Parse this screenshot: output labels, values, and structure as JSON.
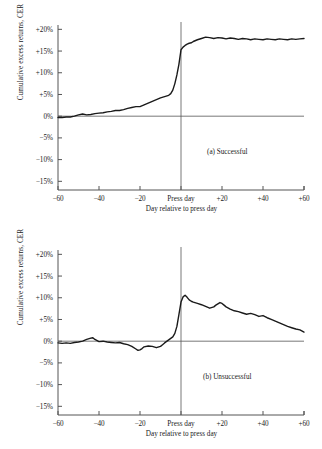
{
  "figure": {
    "title": "",
    "background_color": "#ffffff",
    "line_color": "#1a1a1a",
    "axis_color": "#555555"
  },
  "panels": [
    {
      "id": "a",
      "tag": "(a)  Successful",
      "xlabel": "Day relative to press day",
      "ylabel": "Cumulative excess returns, CER",
      "yticks": [
        "+20%",
        "+15%",
        "+10%",
        "+5%",
        "0%",
        "−5%",
        "−10%",
        "−15%"
      ],
      "ytick_values": [
        20,
        15,
        10,
        5,
        0,
        -5,
        -10,
        -15
      ],
      "xticks": [
        "−60",
        "−40",
        "−20",
        "Press day",
        "+20",
        "+40",
        "+60"
      ],
      "xtick_values": [
        -60,
        -40,
        -20,
        0,
        20,
        40,
        60
      ]
    },
    {
      "id": "b",
      "tag": "(b)  Unsuccessful",
      "xlabel": "Day relative to press day",
      "ylabel": "Cumulative excess returns, CER",
      "yticks": [
        "+20%",
        "+15%",
        "+10%",
        "+5%",
        "0%",
        "−5%",
        "−10%",
        "−15%"
      ],
      "ytick_values": [
        20,
        15,
        10,
        5,
        0,
        -5,
        -10,
        -15
      ],
      "xticks": [
        "−60",
        "−40",
        "−20",
        "Press day",
        "+20",
        "+40",
        "+60"
      ],
      "xtick_values": [
        -60,
        -40,
        -20,
        0,
        20,
        40,
        60
      ]
    }
  ],
  "chart_data": [
    {
      "type": "line",
      "title": "(a)  Successful",
      "xlabel": "Day relative to press day",
      "ylabel": "Cumulative excess returns, CER",
      "xlim": [
        -60,
        60
      ],
      "ylim": [
        -17,
        21
      ],
      "grid": false,
      "legend": "none",
      "annotations": [
        "Press day vertical reference line at x = 0",
        "Zero horizontal reference line at y = 0%"
      ],
      "x": [
        -60,
        -58,
        -56,
        -54,
        -52,
        -50,
        -48,
        -46,
        -44,
        -42,
        -40,
        -38,
        -36,
        -34,
        -32,
        -30,
        -28,
        -26,
        -24,
        -22,
        -20,
        -18,
        -16,
        -14,
        -12,
        -10,
        -8,
        -6,
        -5,
        -4,
        -3,
        -2,
        -1,
        0,
        1,
        2,
        3,
        4,
        5,
        6,
        8,
        10,
        12,
        14,
        16,
        18,
        20,
        22,
        24,
        26,
        28,
        30,
        32,
        34,
        36,
        38,
        40,
        42,
        44,
        46,
        48,
        50,
        52,
        54,
        56,
        58,
        60
      ],
      "y": [
        -0.3,
        -0.3,
        -0.2,
        -0.2,
        0.0,
        0.3,
        0.5,
        0.3,
        0.4,
        0.6,
        0.7,
        0.8,
        1.0,
        1.1,
        1.3,
        1.3,
        1.5,
        1.8,
        2.0,
        2.2,
        2.2,
        2.6,
        3.0,
        3.4,
        3.8,
        4.2,
        4.5,
        4.8,
        5.2,
        6.0,
        7.5,
        9.5,
        12.0,
        15.3,
        15.9,
        16.3,
        16.6,
        16.8,
        16.9,
        17.2,
        17.6,
        17.9,
        18.2,
        18.1,
        17.9,
        18.1,
        18.0,
        17.8,
        18.0,
        17.9,
        17.7,
        17.9,
        17.8,
        17.6,
        17.8,
        17.7,
        17.6,
        17.8,
        17.7,
        17.6,
        17.8,
        17.7,
        17.6,
        17.8,
        17.7,
        17.8,
        17.9
      ]
    },
    {
      "type": "line",
      "title": "(b)  Unsuccessful",
      "xlabel": "Day relative to press day",
      "ylabel": "Cumulative excess returns, CER",
      "xlim": [
        -60,
        60
      ],
      "ylim": [
        -17,
        21
      ],
      "grid": false,
      "legend": "none",
      "annotations": [
        "Press day vertical reference line at x = 0",
        "Zero horizontal reference line at y = 0%"
      ],
      "x": [
        -60,
        -58,
        -56,
        -54,
        -52,
        -50,
        -48,
        -46,
        -44,
        -43,
        -42,
        -40,
        -38,
        -36,
        -34,
        -32,
        -30,
        -28,
        -26,
        -24,
        -22,
        -21,
        -20,
        -19,
        -18,
        -16,
        -14,
        -12,
        -10,
        -9,
        -8,
        -6,
        -4,
        -3,
        -2,
        -1,
        0,
        1,
        2,
        3,
        4,
        5,
        6,
        8,
        10,
        12,
        14,
        16,
        17,
        18,
        19,
        20,
        21,
        22,
        24,
        26,
        28,
        30,
        32,
        34,
        36,
        38,
        40,
        42,
        44,
        46,
        48,
        50,
        52,
        54,
        56,
        58,
        60
      ],
      "y": [
        -0.4,
        -0.5,
        -0.4,
        -0.5,
        -0.3,
        -0.2,
        0.0,
        0.4,
        0.7,
        0.8,
        0.4,
        -0.1,
        0.0,
        -0.2,
        -0.3,
        -0.4,
        -0.3,
        -0.6,
        -0.8,
        -1.2,
        -1.8,
        -2.1,
        -2.0,
        -1.7,
        -1.3,
        -1.1,
        -1.2,
        -1.5,
        -1.2,
        -0.8,
        -0.4,
        0.3,
        1.0,
        1.8,
        3.4,
        6.2,
        9.0,
        10.2,
        10.6,
        10.1,
        9.5,
        9.2,
        9.0,
        8.7,
        8.4,
        8.0,
        7.6,
        7.9,
        8.3,
        8.6,
        8.9,
        8.7,
        8.3,
        7.9,
        7.4,
        7.0,
        6.8,
        6.5,
        6.2,
        6.4,
        6.1,
        5.7,
        5.9,
        5.4,
        5.0,
        4.6,
        4.2,
        3.8,
        3.4,
        3.1,
        2.8,
        2.6,
        2.1
      ]
    }
  ]
}
